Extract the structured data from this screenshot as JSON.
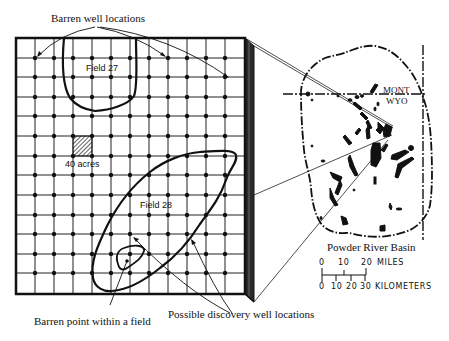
{
  "diagram": {
    "callouts": {
      "barren_wells": "Barren well locations",
      "barren_point": "Barren point within a field",
      "discovery_wells": "Possible discovery well locations"
    },
    "grid": {
      "cell_label": "40 acres",
      "columns": 12,
      "rows": 13,
      "fields": [
        {
          "name": "Field 27"
        },
        {
          "name": "Field 28"
        }
      ]
    },
    "map": {
      "title": "Powder River Basin",
      "state_north": "MONT",
      "state_south": "WYO"
    },
    "scale": {
      "miles_ticks": [
        "0",
        "10",
        "20"
      ],
      "miles_unit": "MILES",
      "km_ticks": [
        "0",
        "10",
        "20",
        "30"
      ],
      "km_unit": "KILOMETERS"
    },
    "colors": {
      "ink": "#111111",
      "paper": "#ffffff",
      "side_face": "#2a2a2a"
    }
  }
}
